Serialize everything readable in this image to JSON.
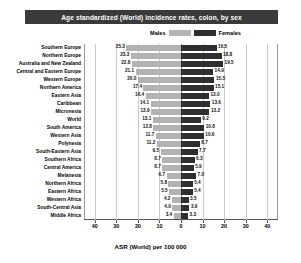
{
  "title": "Age standardized (World) incidence rates, colon, by sex",
  "legend": {
    "male_label": "Males",
    "female_label": "Females",
    "male_color": "#b2b2b2",
    "female_color": "#2e2e2e"
  },
  "axis": {
    "xlabel": "ASR (World) per 100 000",
    "ticks": [
      "40",
      "30",
      "20",
      "10",
      "0",
      "10",
      "20",
      "30",
      "40"
    ],
    "max": 45
  },
  "chart_data": {
    "type": "bar",
    "orientation": "horizontal-diverging",
    "title": "Age standardized (World) incidence rates, colon, by sex",
    "xlabel": "ASR (World) per 100 000",
    "ylabel": "",
    "xlim": [
      -45,
      45
    ],
    "grid": true,
    "legend_position": "top-center",
    "categories": [
      "Southern Europe",
      "Northern Europe",
      "Australia and New Zealand",
      "Central and Eastern Europe",
      "Western Europe",
      "Northern America",
      "Eastern Asia",
      "Caribbean",
      "Micronesia",
      "World",
      "South America",
      "Western Asia",
      "Polynesia",
      "South-Eastern Asia",
      "Southern Africa",
      "Central America",
      "Melanesia",
      "Northern Africa",
      "Eastern Africa",
      "Western Africa",
      "South-Central Asia",
      "Middle Africa"
    ],
    "series": [
      {
        "name": "Males",
        "color": "#b2b2b2",
        "direction": "left",
        "values": [
          25.3,
          23.3,
          22.8,
          21.1,
          20.0,
          17.4,
          16.4,
          14.1,
          13.9,
          13.1,
          12.8,
          11.7,
          11.2,
          9.5,
          8.7,
          8.7,
          6.7,
          5.8,
          5.5,
          4.2,
          4.0,
          3.4
        ]
      },
      {
        "name": "Females",
        "color": "#2e2e2e",
        "direction": "right",
        "values": [
          16.5,
          18.8,
          19.5,
          14.9,
          15.5,
          15.1,
          13.0,
          13.6,
          13.2,
          9.2,
          10.8,
          10.6,
          8.7,
          7.7,
          6.3,
          5.9,
          7.0,
          5.4,
          5.4,
          3.5,
          3.9,
          3.3
        ]
      }
    ]
  }
}
